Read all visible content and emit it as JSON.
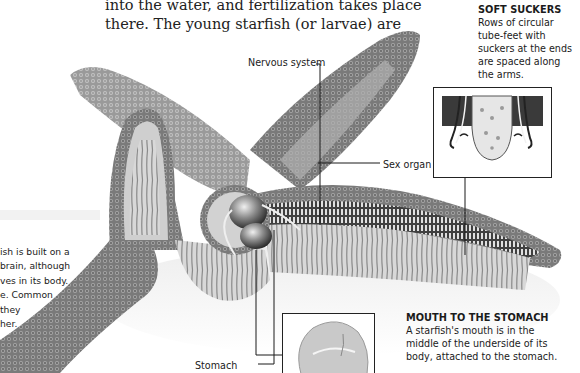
{
  "body_text": {
    "lines": [
      "into the water, and fertilization takes place",
      "there. The young starfish (or larvae) are"
    ]
  },
  "side_text": {
    "lines": [
      "ish is built on a",
      " brain, although",
      "ves in its body.",
      "e. Common",
      " they",
      "her."
    ]
  },
  "captions": {
    "soft_suckers": {
      "title": "SOFT SUCKERS",
      "lines": [
        "Rows of circular",
        "tube-feet with",
        "suckers at the ends",
        "are spaced along",
        "the arms."
      ]
    },
    "mouth_to_stomach": {
      "title": "MOUTH TO THE STOMACH",
      "lines": [
        "A starfish's mouth is in the",
        "middle of the underside of its",
        "body, attached to the stomach."
      ]
    }
  },
  "labels": {
    "nervous_system": "Nervous system",
    "sex_organ": "Sex organ",
    "stomach": "Stomach"
  },
  "colors": {
    "background": "#ffffff",
    "starfish_dark": "#5a5a5a",
    "starfish_mid": "#8c8c8c",
    "starfish_light": "#c8c8c8",
    "leader_line": "#1a1a1a"
  }
}
